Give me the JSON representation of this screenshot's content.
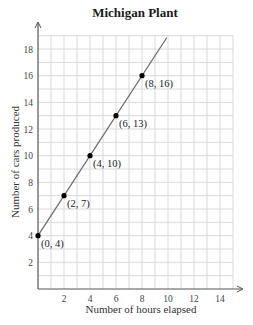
{
  "chart_data": {
    "type": "line",
    "title": "Michigan Plant",
    "xlabel": "Number of hours elapsed",
    "ylabel": "Number of cars produced",
    "x_ticks": [
      2,
      4,
      6,
      8,
      10,
      12,
      14
    ],
    "y_ticks": [
      2,
      4,
      6,
      8,
      10,
      12,
      14,
      16,
      18
    ],
    "xlim": [
      0,
      15
    ],
    "ylim": [
      0,
      19
    ],
    "grid": true,
    "legend": null,
    "series": [
      {
        "name": "Cars produced",
        "equation": "y = 1.5x + 4",
        "line_start": [
          0,
          4
        ],
        "line_end": [
          9.9,
          18.85
        ],
        "points": [
          {
            "x": 0,
            "y": 4,
            "label": "(0, 4)"
          },
          {
            "x": 2,
            "y": 7,
            "label": "(2, 7)"
          },
          {
            "x": 4,
            "y": 10,
            "label": "(4, 10)"
          },
          {
            "x": 6,
            "y": 13,
            "label": "(6, 13)"
          },
          {
            "x": 8,
            "y": 16,
            "label": "(8, 16)"
          }
        ]
      }
    ],
    "colors": {
      "line": "#6e6e6e",
      "point": "#000000",
      "grid": "#d9d9d9",
      "axis": "#555555"
    }
  }
}
